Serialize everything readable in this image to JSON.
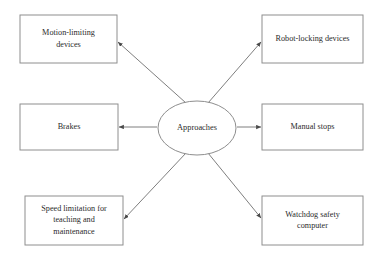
{
  "diagram": {
    "type": "hub-and-spoke",
    "center": {
      "label": "Approaches",
      "shape": "ellipse",
      "cx": 197,
      "cy": 128,
      "rx": 39,
      "ry": 27
    },
    "nodes": [
      {
        "id": "motion-limiting-devices",
        "lines": [
          "Motion-limiting",
          "devices"
        ],
        "shape": "rectangle",
        "x": 20,
        "y": 15,
        "width": 97,
        "height": 48,
        "position": "top-left"
      },
      {
        "id": "robot-locking-devices",
        "lines": [
          "Robot-locking devices"
        ],
        "shape": "rectangle",
        "x": 262,
        "y": 15,
        "width": 101,
        "height": 48,
        "position": "top-right"
      },
      {
        "id": "brakes",
        "lines": [
          "Brakes"
        ],
        "shape": "rectangle",
        "x": 20,
        "y": 104,
        "width": 98,
        "height": 46,
        "position": "middle-left"
      },
      {
        "id": "manual-stops",
        "lines": [
          "Manual stops"
        ],
        "shape": "rectangle",
        "x": 262,
        "y": 104,
        "width": 101,
        "height": 46,
        "position": "middle-right"
      },
      {
        "id": "speed-limitation-for-teaching-and-maintenance",
        "lines": [
          "Speed limitation for",
          "teaching and",
          "maintenance"
        ],
        "shape": "rectangle",
        "x": 25,
        "y": 196,
        "width": 98,
        "height": 49,
        "position": "bottom-left"
      },
      {
        "id": "watchdog-safety-computer",
        "lines": [
          "Watchdog safety",
          "computer"
        ],
        "shape": "rectangle",
        "x": 262,
        "y": 196,
        "width": 101,
        "height": 49,
        "position": "bottom-right"
      }
    ],
    "connectors": [
      {
        "id": "approaches-to-motion-limiting-devices",
        "from": "approaches",
        "to": "motion-limiting-devices",
        "direction": "arrow-end",
        "x1": 186,
        "y1": 103,
        "x2": 118,
        "y2": 42
      },
      {
        "id": "approaches-to-robot-locking-devices",
        "from": "approaches",
        "to": "robot-locking-devices",
        "direction": "arrow-end",
        "x1": 208,
        "y1": 103,
        "x2": 261,
        "y2": 42
      },
      {
        "id": "approaches-to-brakes",
        "from": "approaches",
        "to": "brakes",
        "direction": "arrow-end",
        "x1": 157,
        "y1": 127,
        "x2": 119,
        "y2": 127
      },
      {
        "id": "approaches-to-manual-stops",
        "from": "approaches",
        "to": "manual-stops",
        "direction": "arrow-end",
        "x1": 237,
        "y1": 127,
        "x2": 261,
        "y2": 127
      },
      {
        "id": "approaches-to-speed-limitation",
        "from": "approaches",
        "to": "speed-limitation-for-teaching-and-maintenance",
        "direction": "arrow-end",
        "x1": 186,
        "y1": 153,
        "x2": 124,
        "y2": 219
      },
      {
        "id": "approaches-to-watchdog-safety-computer",
        "from": "approaches",
        "to": "watchdog-safety-computer",
        "direction": "arrow-end",
        "x1": 208,
        "y1": 153,
        "x2": 261,
        "y2": 218
      }
    ],
    "colors": {
      "background": "#ffffff",
      "box_stroke": "#8e8e8e",
      "connector_stroke": "#6f6f6f",
      "text": "#2b2b2b"
    }
  }
}
